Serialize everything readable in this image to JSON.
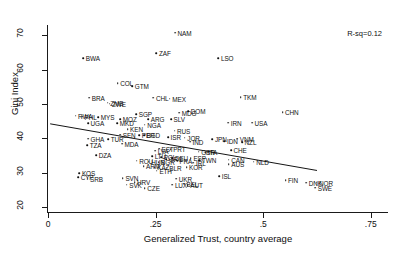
{
  "chart_data": {
    "type": "scatter",
    "title": "",
    "xlabel": "Generalized Trust, country average",
    "ylabel": "Gini Index",
    "xlim": [
      0,
      0.79
    ],
    "ylim": [
      18.5,
      73
    ],
    "xticks": [
      0,
      0.25,
      0.5,
      0.75
    ],
    "xticklabels": [
      "0",
      ".25",
      ".5",
      ".75"
    ],
    "yticks": [
      20,
      30,
      40,
      50,
      60,
      70
    ],
    "yticklabels": [
      "20",
      "30",
      "40",
      "50",
      "60",
      "70"
    ],
    "grid": false,
    "legend": null,
    "annotation": "R-sq=0.12",
    "fit_line": {
      "type": "linear-regression",
      "x_start": 0.005,
      "y_start": 44.2,
      "x_end": 0.625,
      "y_end": 30.6
    },
    "points": [
      {
        "label": "NAM",
        "x": 0.295,
        "y": 70.8
      },
      {
        "label": "ZAF",
        "x": 0.252,
        "y": 64.8
      },
      {
        "label": "BWA",
        "x": 0.082,
        "y": 63.4
      },
      {
        "label": "LSO",
        "x": 0.396,
        "y": 63.4
      },
      {
        "label": "COL",
        "x": 0.162,
        "y": 56.0
      },
      {
        "label": "GTM",
        "x": 0.196,
        "y": 55.1
      },
      {
        "label": "BRA",
        "x": 0.096,
        "y": 51.8
      },
      {
        "label": "CHL",
        "x": 0.245,
        "y": 51.8
      },
      {
        "label": "MEX",
        "x": 0.283,
        "y": 51.5
      },
      {
        "label": "ZMB",
        "x": 0.139,
        "y": 50.4
      },
      {
        "label": "ZWE",
        "x": 0.143,
        "y": 50.1
      },
      {
        "label": "TKM",
        "x": 0.448,
        "y": 52.0
      },
      {
        "label": "CHN",
        "x": 0.545,
        "y": 47.5
      },
      {
        "label": "MDG",
        "x": 0.305,
        "y": 47.4
      },
      {
        "label": "DOM",
        "x": 0.326,
        "y": 47.9
      },
      {
        "label": "RWA",
        "x": 0.064,
        "y": 46.6
      },
      {
        "label": "SGP",
        "x": 0.205,
        "y": 47.0
      },
      {
        "label": "PHL",
        "x": 0.079,
        "y": 46.3
      },
      {
        "label": "MYS",
        "x": 0.117,
        "y": 46.2
      },
      {
        "label": "MOZ",
        "x": 0.168,
        "y": 45.6
      },
      {
        "label": "ARG",
        "x": 0.233,
        "y": 45.6
      },
      {
        "label": "SLV",
        "x": 0.286,
        "y": 45.6
      },
      {
        "label": "UGA",
        "x": 0.093,
        "y": 44.3
      },
      {
        "label": "MKD",
        "x": 0.161,
        "y": 44.3
      },
      {
        "label": "NGA",
        "x": 0.225,
        "y": 44.0
      },
      {
        "label": "IRN",
        "x": 0.419,
        "y": 44.5
      },
      {
        "label": "USA",
        "x": 0.474,
        "y": 44.5
      },
      {
        "label": "KEN",
        "x": 0.185,
        "y": 42.6
      },
      {
        "label": "RUS",
        "x": 0.294,
        "y": 42.2
      },
      {
        "label": "SEN",
        "x": 0.168,
        "y": 41.0
      },
      {
        "label": "PER",
        "x": 0.212,
        "y": 40.9
      },
      {
        "label": "BGD",
        "x": 0.223,
        "y": 40.8
      },
      {
        "label": "ISR",
        "x": 0.279,
        "y": 40.3
      },
      {
        "label": "JOR",
        "x": 0.318,
        "y": 40.2
      },
      {
        "label": "GHA",
        "x": 0.093,
        "y": 39.9
      },
      {
        "label": "TUR",
        "x": 0.14,
        "y": 39.8
      },
      {
        "label": "IDN",
        "x": 0.41,
        "y": 39.2
      },
      {
        "label": "JPN",
        "x": 0.382,
        "y": 39.8
      },
      {
        "label": "VNM",
        "x": 0.44,
        "y": 39.9
      },
      {
        "label": "IND",
        "x": 0.33,
        "y": 39.0
      },
      {
        "label": "NZL",
        "x": 0.451,
        "y": 38.9
      },
      {
        "label": "MDA",
        "x": 0.172,
        "y": 38.4
      },
      {
        "label": "TZA",
        "x": 0.091,
        "y": 37.9
      },
      {
        "label": "EST",
        "x": 0.258,
        "y": 37.0
      },
      {
        "label": "PRT",
        "x": 0.285,
        "y": 36.8
      },
      {
        "label": "LVA",
        "x": 0.249,
        "y": 36.4
      },
      {
        "label": "GBR",
        "x": 0.35,
        "y": 36.1
      },
      {
        "label": "ITA",
        "x": 0.366,
        "y": 36.0
      },
      {
        "label": "CHE",
        "x": 0.425,
        "y": 36.5
      },
      {
        "label": "DZA",
        "x": 0.112,
        "y": 35.0
      },
      {
        "label": "LTU",
        "x": 0.242,
        "y": 34.7
      },
      {
        "label": "POL",
        "x": 0.263,
        "y": 34.4
      },
      {
        "label": "DEU",
        "x": 0.289,
        "y": 34.2
      },
      {
        "label": "GRC",
        "x": 0.275,
        "y": 33.9
      },
      {
        "label": "ESP",
        "x": 0.332,
        "y": 34.1
      },
      {
        "label": "FRA",
        "x": 0.3,
        "y": 33.5
      },
      {
        "label": "TWN",
        "x": 0.352,
        "y": 33.6
      },
      {
        "label": "CAN",
        "x": 0.42,
        "y": 33.7
      },
      {
        "label": "ROU",
        "x": 0.206,
        "y": 33.4
      },
      {
        "label": "HUN",
        "x": 0.234,
        "y": 33.1
      },
      {
        "label": "BGR",
        "x": 0.257,
        "y": 33.0
      },
      {
        "label": "IRL",
        "x": 0.338,
        "y": 32.9
      },
      {
        "label": "NLD",
        "x": 0.478,
        "y": 33.2
      },
      {
        "label": "AUS",
        "x": 0.42,
        "y": 32.5
      },
      {
        "label": "ARM",
        "x": 0.222,
        "y": 31.8
      },
      {
        "label": "KAZ",
        "x": 0.248,
        "y": 31.5
      },
      {
        "label": "BLR",
        "x": 0.276,
        "y": 31.4
      },
      {
        "label": "KOR",
        "x": 0.322,
        "y": 31.6
      },
      {
        "label": "ETH",
        "x": 0.253,
        "y": 30.5
      },
      {
        "label": "KOS",
        "x": 0.073,
        "y": 29.8
      },
      {
        "label": "CYP",
        "x": 0.07,
        "y": 28.6
      },
      {
        "label": "SRB",
        "x": 0.092,
        "y": 28.2
      },
      {
        "label": "SVN",
        "x": 0.174,
        "y": 28.4
      },
      {
        "label": "ISL",
        "x": 0.398,
        "y": 28.9
      },
      {
        "label": "UKR",
        "x": 0.298,
        "y": 28.2
      },
      {
        "label": "HRV",
        "x": 0.201,
        "y": 27.2
      },
      {
        "label": "FIN",
        "x": 0.552,
        "y": 27.8
      },
      {
        "label": "SWE",
        "x": 0.621,
        "y": 25.6
      },
      {
        "label": "DNK",
        "x": 0.6,
        "y": 27.0
      },
      {
        "label": "NOR",
        "x": 0.624,
        "y": 27.0
      },
      {
        "label": "SVK",
        "x": 0.183,
        "y": 26.5
      },
      {
        "label": "BEL",
        "x": 0.316,
        "y": 26.8
      },
      {
        "label": "LUX",
        "x": 0.289,
        "y": 26.4
      },
      {
        "label": "AUT",
        "x": 0.325,
        "y": 26.3
      },
      {
        "label": "CZE",
        "x": 0.225,
        "y": 25.5
      }
    ]
  }
}
